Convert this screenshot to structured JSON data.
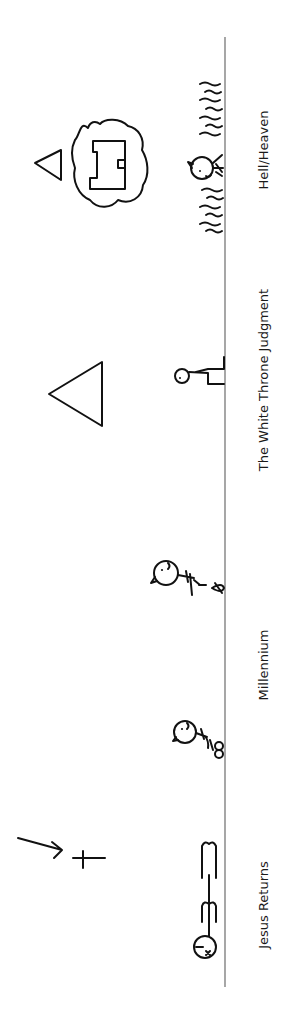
{
  "diagram": {
    "title": "",
    "orientation": "rotated-90-ccw",
    "timeline": {
      "stroke_color": "#777777"
    },
    "stages": [
      {
        "id": "jesus-returns",
        "label": "Jesus Returns",
        "label_y": 905
      },
      {
        "id": "millennium",
        "label": "Millennium",
        "label_y": 665
      },
      {
        "id": "white-throne-judgment",
        "label": "The White Throne Judgment",
        "label_y": 380
      },
      {
        "id": "hell-heaven",
        "label": "Hell/Heaven",
        "label_y": 150
      }
    ],
    "ink_color": "#111111",
    "background": "#ffffff"
  }
}
